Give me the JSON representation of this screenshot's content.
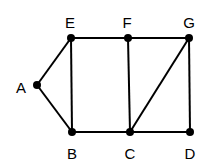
{
  "graph": {
    "nodes": [
      {
        "id": "A",
        "x": 37,
        "y": 85,
        "lx": 21,
        "ly": 87
      },
      {
        "id": "E",
        "x": 71,
        "y": 38,
        "lx": 70,
        "ly": 22
      },
      {
        "id": "F",
        "x": 128,
        "y": 38,
        "lx": 127,
        "ly": 22
      },
      {
        "id": "G",
        "x": 189,
        "y": 38,
        "lx": 189,
        "ly": 22
      },
      {
        "id": "B",
        "x": 72,
        "y": 132,
        "lx": 72,
        "ly": 153
      },
      {
        "id": "C",
        "x": 130,
        "y": 132,
        "lx": 130,
        "ly": 153
      },
      {
        "id": "D",
        "x": 190,
        "y": 132,
        "lx": 190,
        "ly": 153
      }
    ],
    "edges": [
      [
        "A",
        "E"
      ],
      [
        "A",
        "B"
      ],
      [
        "E",
        "B"
      ],
      [
        "E",
        "F"
      ],
      [
        "F",
        "G"
      ],
      [
        "F",
        "C"
      ],
      [
        "G",
        "C"
      ],
      [
        "G",
        "D"
      ],
      [
        "B",
        "C"
      ],
      [
        "C",
        "D"
      ]
    ],
    "colors": {
      "stroke": "#000000",
      "background": "#ffffff"
    }
  }
}
